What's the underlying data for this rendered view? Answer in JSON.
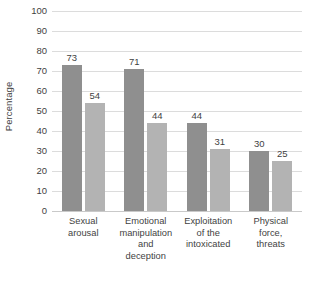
{
  "chart_data": {
    "type": "bar",
    "title": "",
    "xlabel": "",
    "ylabel": "Percentage",
    "ylim": [
      0,
      100
    ],
    "ytick_step": 10,
    "yticks": [
      100,
      90,
      80,
      70,
      60,
      50,
      40,
      30,
      20,
      10,
      0
    ],
    "grid": true,
    "legend": "none",
    "categories": [
      "Sexual arousal",
      "Emotional manipulation and deception",
      "Exploitation of the intoxicated",
      "Physical force, threats"
    ],
    "category_lines": [
      [
        "Sexual",
        "arousal"
      ],
      [
        "Emotional",
        "manipulation",
        "and",
        "deception"
      ],
      [
        "Exploitation",
        "of the",
        "intoxicated"
      ],
      [
        "Physical",
        "force,",
        "threats"
      ]
    ],
    "series": [
      {
        "name": "series-1",
        "color": "#8f8f8f",
        "values": [
          73,
          71,
          44,
          30
        ]
      },
      {
        "name": "series-2",
        "color": "#b3b3b3",
        "values": [
          54,
          44,
          31,
          25
        ]
      }
    ],
    "bar_labels": [
      [
        "73",
        "54"
      ],
      [
        "71",
        "44"
      ],
      [
        "44",
        "31"
      ],
      [
        "30",
        "25"
      ]
    ]
  },
  "colors": {
    "gridline": "#dcdcdc",
    "baseline": "#c9c9c9",
    "text": "#3f3f3f",
    "background": "#ffffff",
    "series_dark": "#8f8f8f",
    "series_light": "#b3b3b3"
  }
}
